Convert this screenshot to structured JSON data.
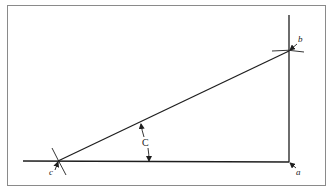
{
  "diagram": {
    "colors": {
      "frame": "#8a8a8a",
      "line": "#1e1e1e",
      "background": "#ffffff"
    },
    "points": {
      "a": {
        "label": "a",
        "x": 289,
        "y": 162
      },
      "b": {
        "label": "b",
        "x": 289,
        "y": 51
      },
      "c": {
        "label": "c",
        "x": 58,
        "y": 161
      }
    },
    "angle": {
      "label": "C",
      "vertex": "c"
    }
  }
}
